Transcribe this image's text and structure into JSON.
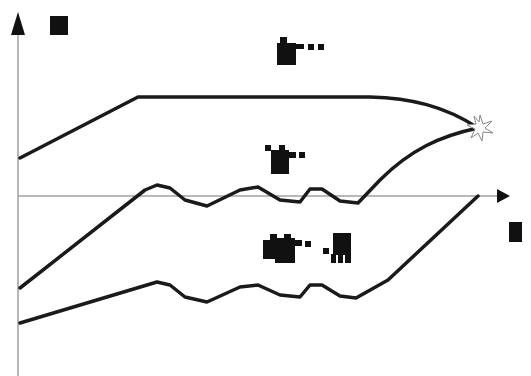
{
  "diagram": {
    "type": "schematic-curves",
    "axes": {
      "y_axis": {
        "x": 18,
        "top": 15,
        "bottom": 376,
        "label_glyph": "block-label-y",
        "color": "#a0a0a0"
      },
      "x_axis": {
        "y": 196,
        "left": 18,
        "right": 500,
        "label_glyph": "block-label-x",
        "color": "#a0a0a0"
      }
    },
    "curves": [
      {
        "name": "upper-curve",
        "color": "#1a1a1a",
        "path": "M20,158 L138,97 L370,97 C410,98 445,106 478,128"
      },
      {
        "name": "middle-curve",
        "color": "#1a1a1a",
        "path": "M20,288 L145,190 L157,185 L170,188 L185,200 L207,206 L240,190 L258,187 L280,200 L300,202 L310,189 L322,189 L340,201 L358,203 L380,180 C410,150 440,136 478,128"
      },
      {
        "name": "lower-curve",
        "color": "#1a1a1a",
        "path": "M20,323 L157,282 L170,285 L185,297 L207,302 L240,287 L258,285 L280,295 L300,297 L310,285 L322,285 L340,296 L356,298 L388,280 L478,196"
      }
    ],
    "marker": {
      "name": "star-marker",
      "x": 478,
      "y": 128,
      "color": "#888888"
    },
    "labels": [
      {
        "name": "label-y-axis",
        "text": "■",
        "x": 50,
        "y": 17
      },
      {
        "name": "label-upper-region",
        "text": "■▪▪▪",
        "x": 278,
        "y": 36
      },
      {
        "name": "label-middle-curve",
        "text": "▪■▪",
        "x": 265,
        "y": 145
      },
      {
        "name": "label-lower-region",
        "text": "■■▪▪ ▪■",
        "x": 262,
        "y": 233
      },
      {
        "name": "label-x-axis",
        "text": "■",
        "x": 509,
        "y": 222
      }
    ]
  }
}
